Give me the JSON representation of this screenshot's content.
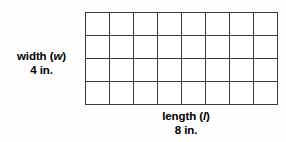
{
  "figure": {
    "type": "area-model-rectangle",
    "grid": {
      "columns": 8,
      "rows": 4,
      "total_cells": 32,
      "line_color": "#3b3b3b",
      "cell_fill": "#ffffff"
    },
    "width_label": {
      "name_text": "width (",
      "variable": "w",
      "name_text_close": ")",
      "measure": "4 in."
    },
    "length_label": {
      "name_text": "length (",
      "variable": "l",
      "name_text_close": ")",
      "measure": "8 in."
    }
  },
  "chart_data": {
    "type": "table",
    "title": "",
    "columns": 8,
    "rows": 4,
    "xlabel": "length (l) 8 in.",
    "ylabel": "width (w) 4 in.",
    "values": [
      [
        1,
        1,
        1,
        1,
        1,
        1,
        1,
        1
      ],
      [
        1,
        1,
        1,
        1,
        1,
        1,
        1,
        1
      ],
      [
        1,
        1,
        1,
        1,
        1,
        1,
        1,
        1
      ],
      [
        1,
        1,
        1,
        1,
        1,
        1,
        1,
        1
      ]
    ],
    "grid": true,
    "legend": "none"
  }
}
